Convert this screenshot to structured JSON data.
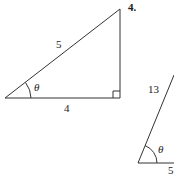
{
  "problems": [
    {
      "number": "3.",
      "hypotenuse_label": "5",
      "base_label": "4",
      "angle_label": "θ",
      "right_angle": true
    },
    {
      "number": "4.",
      "hypotenuse_label": "13",
      "base_label": "5",
      "angle_label": "θ"
    }
  ],
  "colors": {
    "line": "#333333",
    "text": "#222222",
    "background": "#ffffff"
  }
}
